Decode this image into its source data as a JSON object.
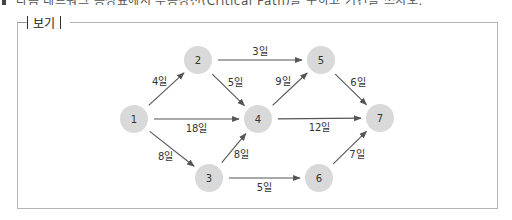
{
  "header": {
    "cropped_text": "다음 네트워크 공정표에서 주공정선(Critical Path)을 구하고 기간을 쓰시오."
  },
  "box": {
    "legend_label": "보기"
  },
  "diagram": {
    "type": "network",
    "colors": {
      "node_fill": "#d9d9d9",
      "edge": "#555555",
      "text": "#333333"
    },
    "nodes": [
      {
        "id": "1",
        "label": "1",
        "x": 134,
        "y": 119
      },
      {
        "id": "2",
        "label": "2",
        "x": 198,
        "y": 60
      },
      {
        "id": "3",
        "label": "3",
        "x": 209,
        "y": 178
      },
      {
        "id": "4",
        "label": "4",
        "x": 258,
        "y": 119
      },
      {
        "id": "5",
        "label": "5",
        "x": 321,
        "y": 60
      },
      {
        "id": "6",
        "label": "6",
        "x": 319,
        "y": 178
      },
      {
        "id": "7",
        "label": "7",
        "x": 380,
        "y": 118
      }
    ],
    "edges": [
      {
        "from": "1",
        "to": "2",
        "label": "4일"
      },
      {
        "from": "1",
        "to": "4",
        "label": "18일"
      },
      {
        "from": "1",
        "to": "3",
        "label": "8일"
      },
      {
        "from": "2",
        "to": "5",
        "label": "3일"
      },
      {
        "from": "2",
        "to": "4",
        "label": "5일"
      },
      {
        "from": "3",
        "to": "4",
        "label": "8일"
      },
      {
        "from": "3",
        "to": "6",
        "label": "5일"
      },
      {
        "from": "4",
        "to": "5",
        "label": "9일"
      },
      {
        "from": "4",
        "to": "7",
        "label": "12일"
      },
      {
        "from": "5",
        "to": "7",
        "label": "6일"
      },
      {
        "from": "6",
        "to": "7",
        "label": "7일"
      }
    ]
  }
}
